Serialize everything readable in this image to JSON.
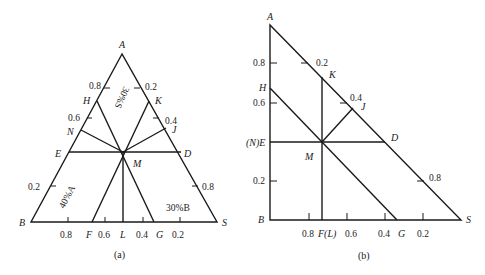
{
  "diagram_a": {
    "caption": "(a)",
    "vertices": {
      "A": "A",
      "B": "B",
      "S": "S"
    },
    "points": {
      "H": "H",
      "N": "N",
      "E": "E",
      "K": "K",
      "J": "J",
      "D": "D",
      "M": "M",
      "F": "F",
      "L": "L",
      "G": "G"
    },
    "left_ticks": [
      "0.8",
      "0.6",
      "0.2"
    ],
    "right_ticks": [
      "0.2",
      "0.4",
      "0.8"
    ],
    "bottom_ticks": [
      "0.8",
      "0.6",
      "0.4",
      "0.2"
    ],
    "annotations": {
      "s30": "30%S",
      "a40": "40%A",
      "b30": "30%B"
    }
  },
  "diagram_b": {
    "caption": "(b)",
    "vertices": {
      "A": "A",
      "B": "B",
      "S": "S"
    },
    "points": {
      "H": "H",
      "NE": "(N)E",
      "K": "K",
      "J": "J",
      "D": "D",
      "M": "M",
      "FL": "F(L)",
      "G": "G"
    },
    "left_ticks": [
      "0.8",
      "0.6",
      "0.2"
    ],
    "hyp_ticks": [
      "0.2",
      "0.4",
      "0.8"
    ],
    "bottom_ticks": [
      "0.8",
      "0.6",
      "0.4",
      "0.2"
    ]
  }
}
